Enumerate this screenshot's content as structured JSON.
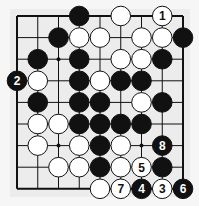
{
  "diagram": {
    "type": "go-board-diagram",
    "grid": {
      "cols": 9,
      "rows": 9
    },
    "board_color": "#ececec",
    "line_color": "#111111",
    "star_points": [
      [
        2,
        2
      ],
      [
        6,
        2
      ],
      [
        2,
        6
      ],
      [
        6,
        6
      ],
      [
        4,
        4
      ]
    ],
    "stones": [
      {
        "color": "black",
        "col": 3,
        "row": 0,
        "label": ""
      },
      {
        "color": "white",
        "col": 5,
        "row": 0,
        "label": ""
      },
      {
        "color": "white",
        "col": 7,
        "row": 0,
        "label": "1"
      },
      {
        "color": "black",
        "col": 2,
        "row": 1,
        "label": ""
      },
      {
        "color": "white",
        "col": 3,
        "row": 1,
        "label": ""
      },
      {
        "color": "white",
        "col": 4,
        "row": 1,
        "label": ""
      },
      {
        "color": "white",
        "col": 6,
        "row": 1,
        "label": ""
      },
      {
        "color": "white",
        "col": 7,
        "row": 1,
        "label": ""
      },
      {
        "color": "black",
        "col": 8,
        "row": 1,
        "label": ""
      },
      {
        "color": "black",
        "col": 1,
        "row": 2,
        "label": ""
      },
      {
        "color": "black",
        "col": 3,
        "row": 2,
        "label": ""
      },
      {
        "color": "white",
        "col": 5,
        "row": 2,
        "label": ""
      },
      {
        "color": "white",
        "col": 6,
        "row": 2,
        "label": ""
      },
      {
        "color": "black",
        "col": 7,
        "row": 2,
        "label": ""
      },
      {
        "color": "black",
        "col": 0,
        "row": 3,
        "label": "2"
      },
      {
        "color": "white",
        "col": 1,
        "row": 3,
        "label": ""
      },
      {
        "color": "black",
        "col": 3,
        "row": 3,
        "label": ""
      },
      {
        "color": "white",
        "col": 4,
        "row": 3,
        "label": ""
      },
      {
        "color": "black",
        "col": 5,
        "row": 3,
        "label": ""
      },
      {
        "color": "black",
        "col": 6,
        "row": 3,
        "label": ""
      },
      {
        "color": "black",
        "col": 1,
        "row": 4,
        "label": ""
      },
      {
        "color": "black",
        "col": 3,
        "row": 4,
        "label": ""
      },
      {
        "color": "black",
        "col": 4,
        "row": 4,
        "label": ""
      },
      {
        "color": "white",
        "col": 6,
        "row": 4,
        "label": ""
      },
      {
        "color": "black",
        "col": 7,
        "row": 4,
        "label": ""
      },
      {
        "color": "white",
        "col": 1,
        "row": 5,
        "label": ""
      },
      {
        "color": "white",
        "col": 2,
        "row": 5,
        "label": ""
      },
      {
        "color": "black",
        "col": 3,
        "row": 5,
        "label": ""
      },
      {
        "color": "black",
        "col": 4,
        "row": 5,
        "label": ""
      },
      {
        "color": "black",
        "col": 5,
        "row": 5,
        "label": ""
      },
      {
        "color": "black",
        "col": 6,
        "row": 5,
        "label": ""
      },
      {
        "color": "white",
        "col": 1,
        "row": 6,
        "label": ""
      },
      {
        "color": "white",
        "col": 3,
        "row": 6,
        "label": ""
      },
      {
        "color": "black",
        "col": 4,
        "row": 6,
        "label": ""
      },
      {
        "color": "white",
        "col": 5,
        "row": 6,
        "label": ""
      },
      {
        "color": "black",
        "col": 7,
        "row": 6,
        "label": "8"
      },
      {
        "color": "white",
        "col": 2,
        "row": 7,
        "label": ""
      },
      {
        "color": "white",
        "col": 3,
        "row": 7,
        "label": ""
      },
      {
        "color": "black",
        "col": 4,
        "row": 7,
        "label": ""
      },
      {
        "color": "white",
        "col": 5,
        "row": 7,
        "label": ""
      },
      {
        "color": "white",
        "col": 6,
        "row": 7,
        "label": "5"
      },
      {
        "color": "black",
        "col": 7,
        "row": 7,
        "label": ""
      },
      {
        "color": "white",
        "col": 4,
        "row": 8,
        "label": ""
      },
      {
        "color": "white",
        "col": 5,
        "row": 8,
        "label": "7"
      },
      {
        "color": "black",
        "col": 6,
        "row": 8,
        "label": "4"
      },
      {
        "color": "white",
        "col": 7,
        "row": 8,
        "label": "3"
      },
      {
        "color": "black",
        "col": 8,
        "row": 8,
        "label": "6"
      }
    ]
  }
}
